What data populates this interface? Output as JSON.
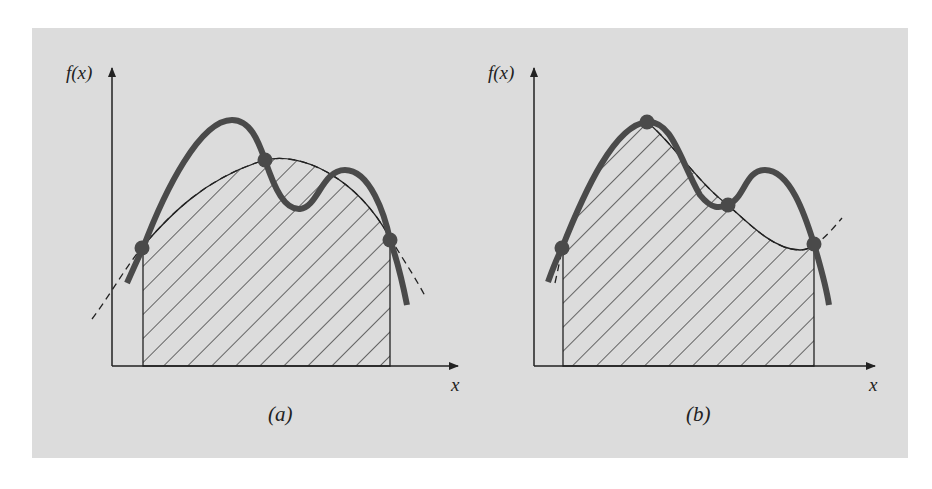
{
  "figure": {
    "background_color": "#dcdcdc",
    "curve_color": "#4a4a4a",
    "line_color": "#222222",
    "panels": [
      {
        "id": "a",
        "caption": "(a)",
        "y_axis_label": "f(x)",
        "x_axis_label": "x",
        "description": "Single quadratic (dashed) fit through three points on f(x); hatched area under the dashed parabola between the outer points"
      },
      {
        "id": "b",
        "caption": "(b)",
        "y_axis_label": "f(x)",
        "x_axis_label": "x",
        "description": "Cubic (dashed) fit through four points on f(x); hatched area under the dashed cubic between the outer points"
      }
    ]
  }
}
